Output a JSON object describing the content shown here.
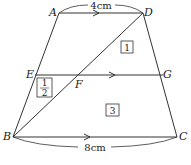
{
  "diagram": {
    "type": "geometry-trapezoid",
    "points": {
      "A": {
        "label": "A",
        "x": 59,
        "y": 13
      },
      "D": {
        "label": "D",
        "x": 143,
        "y": 13
      },
      "E": {
        "label": "E",
        "x": 35,
        "y": 75
      },
      "F": {
        "label": "F",
        "x": 79,
        "y": 75
      },
      "G": {
        "label": "G",
        "x": 163,
        "y": 75
      },
      "B": {
        "label": "B",
        "x": 13,
        "y": 137
      },
      "C": {
        "label": "C",
        "x": 177,
        "y": 137
      }
    },
    "measurements": {
      "top": "4cm",
      "bottom": "8cm"
    },
    "regions": {
      "r1": "1",
      "r2_num": "1",
      "r2_den": "2",
      "r3": "3"
    },
    "colors": {
      "stroke": "#333333",
      "text": "#222222",
      "background": "#ffffff"
    }
  }
}
